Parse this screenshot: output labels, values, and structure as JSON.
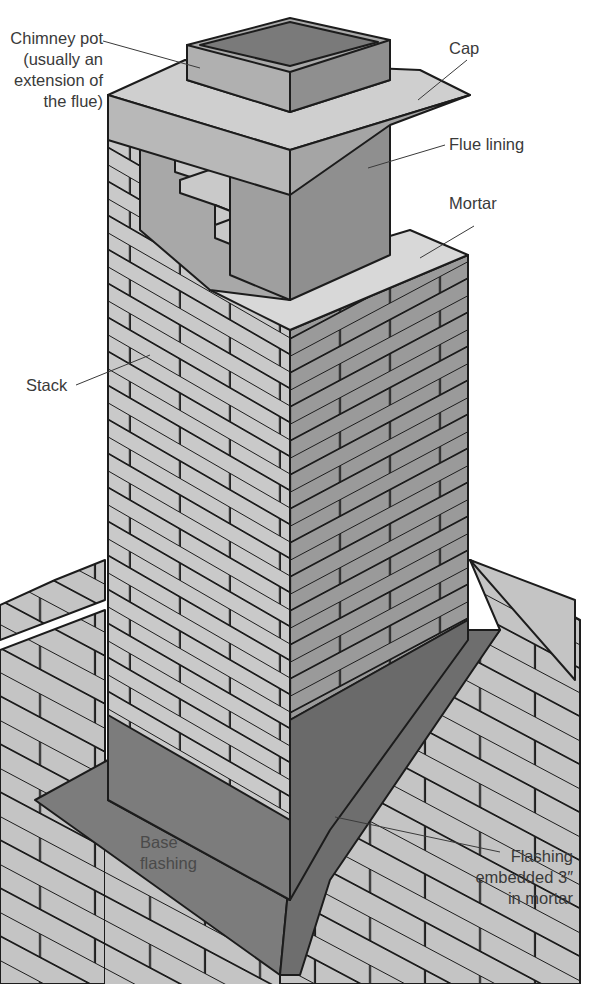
{
  "diagram": {
    "labels": {
      "chimney_pot": "Chimney pot\n(usually an\nextension of\nthe flue)",
      "cap": "Cap",
      "flue_lining": "Flue lining",
      "mortar": "Mortar",
      "stack": "Stack",
      "base_flashing": "Base\nflashing",
      "flashing_embedded": "Flashing\nembedded 3″\nin mortar"
    },
    "colors": {
      "background": "#ffffff",
      "brick_light": "#c9c9c9",
      "brick_dark": "#9a9a9a",
      "flue": "#8f8f8f",
      "flue_inside": "#7a7a7a",
      "mortar": "#d8d8d8",
      "flashing": "#7c7c7c",
      "shingle": "#c4c4c4",
      "outline": "#1c1c1c",
      "text": "#3a3a3a"
    }
  }
}
